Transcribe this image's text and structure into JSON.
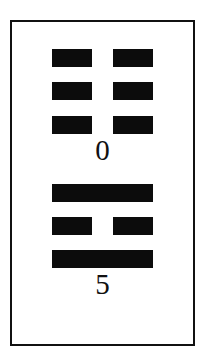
{
  "figure": {
    "frame_color": "#111111",
    "bar_color": "#0c0c0c",
    "hexagram_top": {
      "label": "0",
      "lines": [
        {
          "type": "broken"
        },
        {
          "type": "broken"
        },
        {
          "type": "broken"
        }
      ]
    },
    "hexagram_bottom": {
      "label": "5",
      "lines": [
        {
          "type": "solid"
        },
        {
          "type": "broken"
        },
        {
          "type": "solid"
        }
      ]
    }
  }
}
